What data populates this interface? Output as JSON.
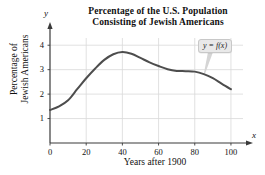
{
  "chart_data": {
    "type": "line",
    "title": "Percentage of the U.S. Population Consisting of Jewish Americans",
    "title_line1": "Percentage of the U.S. Population",
    "title_line2": "Consisting of Jewish Americans",
    "xlabel": "Years after 1900",
    "ylabel": "Percentage of Jewish Americans",
    "ylabel_line1": "Percentage of",
    "ylabel_line2": "Jewish Americans",
    "x_axis_symbol": "x",
    "y_axis_symbol": "y",
    "xlim": [
      0,
      105
    ],
    "ylim": [
      0,
      4.5
    ],
    "xticks": [
      0,
      20,
      40,
      60,
      80,
      100
    ],
    "yticks": [
      1,
      2,
      3,
      4
    ],
    "grid": true,
    "legend": "none",
    "annotation": "y = f(x)",
    "curve_color": "#4d4d4d",
    "grid_color": "#d9d9d9",
    "axis_color": "#3a3a3a",
    "x": [
      0,
      5,
      10,
      15,
      20,
      25,
      30,
      35,
      40,
      45,
      50,
      55,
      60,
      65,
      70,
      75,
      80,
      85,
      90,
      95,
      100
    ],
    "y": [
      1.35,
      1.5,
      1.75,
      2.2,
      2.65,
      3.05,
      3.4,
      3.63,
      3.72,
      3.65,
      3.48,
      3.3,
      3.15,
      3.02,
      2.95,
      2.94,
      2.92,
      2.82,
      2.65,
      2.42,
      2.2
    ]
  }
}
